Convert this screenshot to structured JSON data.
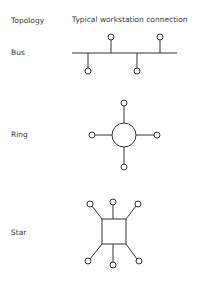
{
  "header": {
    "col1": "Topology",
    "col2": "Typical workstation connection"
  },
  "topologies": [
    {
      "name": "Bus",
      "nodes": 4
    },
    {
      "name": "Ring",
      "nodes": 4
    },
    {
      "name": "Star",
      "nodes": 6
    }
  ],
  "colors": {
    "stroke": "#333333",
    "background": "#ffffff"
  }
}
